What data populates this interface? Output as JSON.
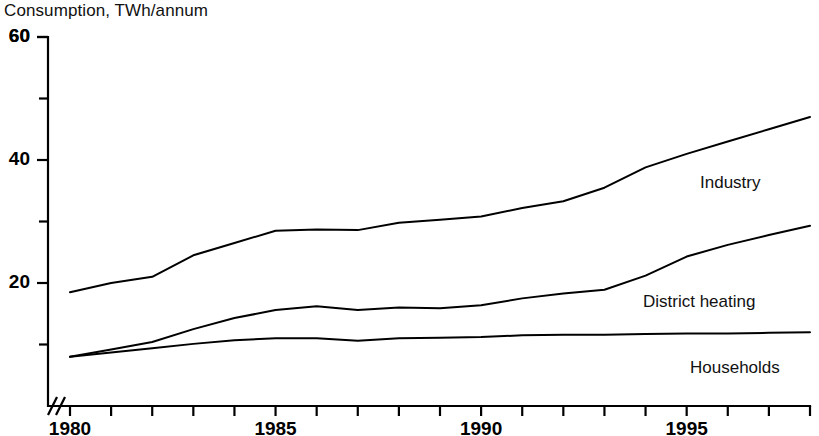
{
  "chart_data": {
    "type": "line",
    "title": "Consumption, TWh/annum",
    "ylabel": "Consumption, TWh/annum",
    "xlabel": "",
    "xlim": [
      1980,
      1998
    ],
    "ylim": [
      0,
      60
    ],
    "grid": false,
    "legend_position": "inline-right",
    "axis_break": "//",
    "y_major_ticks": [
      20,
      40,
      60
    ],
    "y_minor_ticks": [
      10,
      30,
      50
    ],
    "y_tick_labels": [
      "20",
      "40",
      "60"
    ],
    "x": [
      1980,
      1981,
      1982,
      1983,
      1984,
      1985,
      1986,
      1987,
      1988,
      1989,
      1990,
      1991,
      1992,
      1993,
      1994,
      1995,
      1996,
      1997,
      1998
    ],
    "x_tick_labels": [
      "1980",
      "1985",
      "1990",
      "1995"
    ],
    "x_tick_values": [
      1980,
      1985,
      1990,
      1995
    ],
    "series": [
      {
        "name": "Industry",
        "values": [
          18.5,
          20.0,
          21.0,
          24.5,
          26.5,
          28.5,
          28.7,
          28.6,
          29.8,
          30.3,
          30.8,
          32.2,
          33.3,
          35.5,
          38.8,
          41.0,
          43.0,
          45.0,
          47.0
        ]
      },
      {
        "name": "District heating",
        "values": [
          8.0,
          9.2,
          10.4,
          12.5,
          14.3,
          15.6,
          16.2,
          15.6,
          16.0,
          15.9,
          16.4,
          17.5,
          18.3,
          18.9,
          21.2,
          24.3,
          26.2,
          27.8,
          29.3
        ]
      },
      {
        "name": "Households",
        "values": [
          8.0,
          8.7,
          9.4,
          10.1,
          10.7,
          11.0,
          11.0,
          10.6,
          11.0,
          11.1,
          11.2,
          11.5,
          11.6,
          11.6,
          11.7,
          11.8,
          11.8,
          11.9,
          12.0
        ]
      }
    ]
  },
  "labels": {
    "industry": "Industry",
    "district_heating": "District heating",
    "households": "Households"
  }
}
